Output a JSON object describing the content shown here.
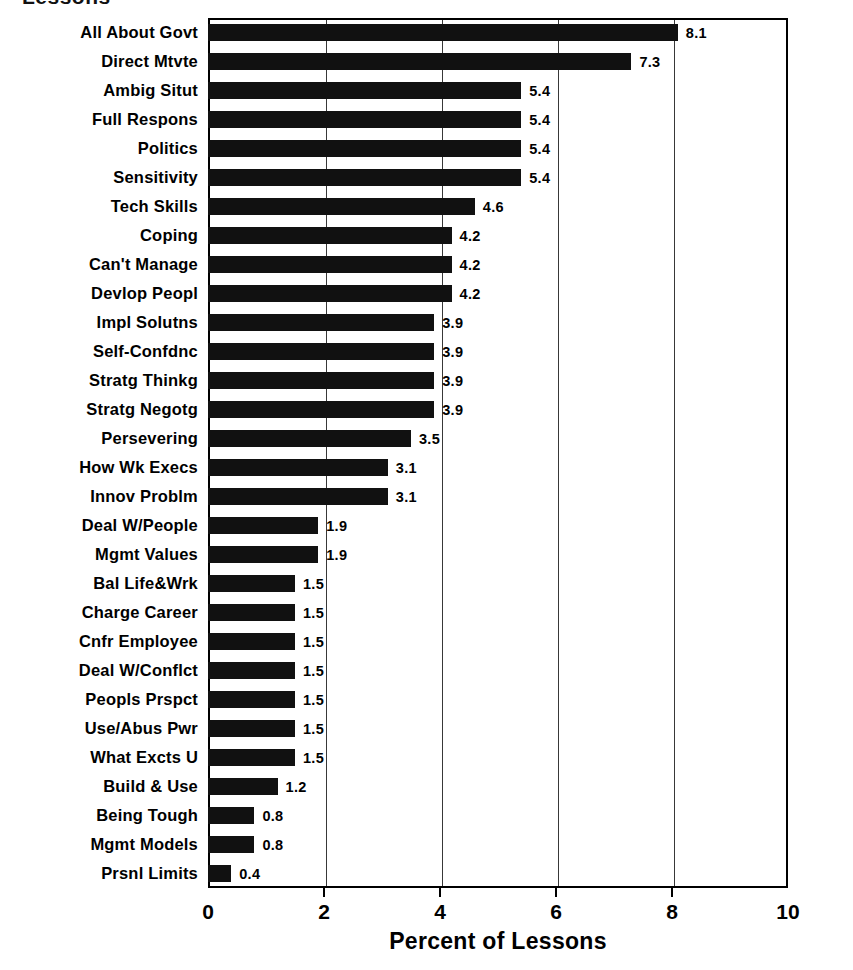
{
  "chart_data": {
    "type": "bar",
    "orientation": "horizontal",
    "title": "Lessons",
    "xlabel": "Percent of Lessons",
    "ylabel": "",
    "xlim": [
      0,
      10
    ],
    "xticks": [
      "0",
      "2",
      "4",
      "6",
      "8",
      "10"
    ],
    "xtick_values": [
      0,
      2,
      4,
      6,
      8,
      10
    ],
    "grid": true,
    "grid_axis": "x",
    "legend": null,
    "bar_color": "#111111",
    "background_color": "#ffffff",
    "categories": [
      "All About Govt",
      "Direct Mtvte",
      "Ambig Situt",
      "Full Respons",
      "Politics",
      "Sensitivity",
      "Tech Skills",
      "Coping",
      "Can't Manage",
      "Devlop Peopl",
      "Impl Solutns",
      "Self-Confdnc",
      "Stratg Thinkg",
      "Stratg Negotg",
      "Persevering",
      "How Wk Execs",
      "Innov Problm",
      "Deal W/People",
      "Mgmt Values",
      "Bal Life&Wrk",
      "Charge Career",
      "Cnfr Employee",
      "Deal W/Conflct",
      "Peopls Prspct",
      "Use/Abus Pwr",
      "What Excts U",
      "Build & Use",
      "Being Tough",
      "Mgmt Models",
      "Prsnl Limits"
    ],
    "values": [
      8.1,
      7.3,
      5.4,
      5.4,
      5.4,
      5.4,
      4.6,
      4.2,
      4.2,
      4.2,
      3.9,
      3.9,
      3.9,
      3.9,
      3.5,
      3.1,
      3.1,
      1.9,
      1.9,
      1.5,
      1.5,
      1.5,
      1.5,
      1.5,
      1.5,
      1.5,
      1.2,
      0.8,
      0.8,
      0.4
    ],
    "value_labels": [
      "8.1",
      "7.3",
      "5.4",
      "5.4",
      "5.4",
      "5.4",
      "4.6",
      "4.2",
      "4.2",
      "4.2",
      "3.9",
      "3.9",
      "3.9",
      "3.9",
      "3.5",
      "3.1",
      "3.1",
      "1.9",
      "1.9",
      "1.5",
      "1.5",
      "1.5",
      "1.5",
      "1.5",
      "1.5",
      "1.5",
      "1.2",
      "0.8",
      "0.8",
      "0.4"
    ]
  }
}
